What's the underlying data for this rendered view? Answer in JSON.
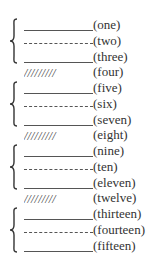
{
  "groups": [
    {
      "items": [
        {
          "label": "(one)",
          "style": "solid"
        },
        {
          "label": "(two)",
          "style": "dashed"
        },
        {
          "label": "(three)",
          "style": "solid"
        }
      ]
    },
    {
      "items": [
        {
          "label": "(five)",
          "style": "solid"
        },
        {
          "label": "(six)",
          "style": "dashed"
        },
        {
          "label": "(seven)",
          "style": "solid"
        }
      ]
    },
    {
      "items": [
        {
          "label": "(nine)",
          "style": "solid"
        },
        {
          "label": "(ten)",
          "style": "dashed"
        },
        {
          "label": "(eleven)",
          "style": "solid"
        }
      ]
    },
    {
      "items": [
        {
          "label": "(thirteen)",
          "style": "solid"
        },
        {
          "label": "(fourteen)",
          "style": "dashed"
        },
        {
          "label": "(fifteen)",
          "style": "solid"
        }
      ]
    }
  ],
  "separators": [
    {
      "label": "(four)",
      "pattern": "/////////"
    },
    {
      "label": "(eight)",
      "pattern": "/////////"
    },
    {
      "label": "(twelve)",
      "pattern": "/////////"
    }
  ],
  "colors": {
    "line": "#555555",
    "text": "#333333",
    "background": "#ffffff"
  }
}
